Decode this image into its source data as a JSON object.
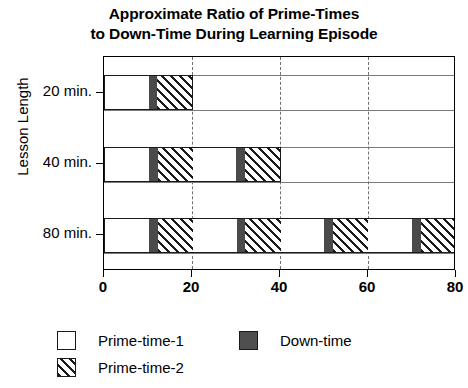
{
  "chart_data": {
    "type": "bar",
    "orientation": "horizontal",
    "stacked": true,
    "title": "Approximate Ratio of Prime-Times to Down-Time During Learning Episode",
    "title_line_1": "Approximate Ratio of Prime-Times",
    "title_line_2": "to Down-Time During Learning Episode",
    "xlabel": "",
    "ylabel": "Lesson Length",
    "categories": [
      "20 min.",
      "40 min.",
      "80 min."
    ],
    "xlim": [
      0,
      80
    ],
    "xticks": [
      0,
      20,
      40,
      60,
      80
    ],
    "xtick_labels": [
      "0",
      "20",
      "40",
      "60",
      "80"
    ],
    "grid": "vertical-dashed",
    "legend_position": "bottom-left",
    "series": [
      {
        "name": "Prime-time-1",
        "fill": "white",
        "color": "#ffffff"
      },
      {
        "name": "Down-time",
        "fill": "solid-dark",
        "color": "#4a4a4a"
      },
      {
        "name": "Prime-time-2",
        "fill": "diagonal-hatch",
        "color": "#1a1a1a"
      }
    ],
    "bars": [
      {
        "category": "20 min.",
        "total": 20,
        "segments": [
          {
            "series": "Prime-time-1",
            "start": 0,
            "end": 10,
            "value": 10
          },
          {
            "series": "Down-time",
            "start": 10,
            "end": 12,
            "value": 2
          },
          {
            "series": "Prime-time-2",
            "start": 12,
            "end": 20,
            "value": 8
          }
        ]
      },
      {
        "category": "40 min.",
        "total": 40,
        "segments": [
          {
            "series": "Prime-time-1",
            "start": 0,
            "end": 10,
            "value": 10
          },
          {
            "series": "Down-time",
            "start": 10,
            "end": 12,
            "value": 2
          },
          {
            "series": "Prime-time-2",
            "start": 12,
            "end": 20,
            "value": 8
          },
          {
            "series": "Prime-time-1",
            "start": 20,
            "end": 30,
            "value": 10
          },
          {
            "series": "Down-time",
            "start": 30,
            "end": 32,
            "value": 2
          },
          {
            "series": "Prime-time-2",
            "start": 32,
            "end": 40,
            "value": 8
          }
        ]
      },
      {
        "category": "80 min.",
        "total": 80,
        "segments": [
          {
            "series": "Prime-time-1",
            "start": 0,
            "end": 10,
            "value": 10
          },
          {
            "series": "Down-time",
            "start": 10,
            "end": 12,
            "value": 2
          },
          {
            "series": "Prime-time-2",
            "start": 12,
            "end": 20,
            "value": 8
          },
          {
            "series": "Prime-time-1",
            "start": 20,
            "end": 30,
            "value": 10
          },
          {
            "series": "Down-time",
            "start": 30,
            "end": 32,
            "value": 2
          },
          {
            "series": "Prime-time-2",
            "start": 32,
            "end": 40,
            "value": 8
          },
          {
            "series": "Prime-time-1",
            "start": 40,
            "end": 50,
            "value": 10
          },
          {
            "series": "Down-time",
            "start": 50,
            "end": 52,
            "value": 2
          },
          {
            "series": "Prime-time-2",
            "start": 52,
            "end": 60,
            "value": 8
          },
          {
            "series": "Prime-time-1",
            "start": 60,
            "end": 70,
            "value": 10
          },
          {
            "series": "Down-time",
            "start": 70,
            "end": 72,
            "value": 2
          },
          {
            "series": "Prime-time-2",
            "start": 72,
            "end": 80,
            "value": 8
          }
        ]
      }
    ],
    "legend_entries": [
      {
        "label": "Prime-time-1",
        "fill": "white"
      },
      {
        "label": "Down-time",
        "fill": "solid-dark"
      },
      {
        "label": "Prime-time-2",
        "fill": "diagonal-hatch"
      }
    ]
  }
}
